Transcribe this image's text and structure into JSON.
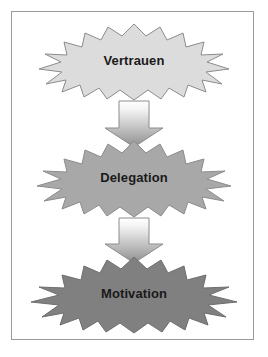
{
  "diagram": {
    "background_color": "#ffffff",
    "frame_color": "#9a9a9a",
    "text_color": "#1a1a1a",
    "nodes": [
      {
        "id": "node-vertrauen",
        "label": "Vertrauen",
        "shape": "explosion-star",
        "fill": "#dcdcdc",
        "stroke": "#8c8c8c"
      },
      {
        "id": "node-delegation",
        "label": "Delegation",
        "shape": "explosion-star",
        "fill": "#a8a8a8",
        "stroke": "#8c8c8c"
      },
      {
        "id": "node-motivation",
        "label": "Motivation",
        "shape": "explosion-star",
        "fill": "#808080",
        "stroke": "#6e6e6e"
      }
    ],
    "connectors": [
      {
        "id": "arrow-vertrauen-delegation",
        "shape": "block-arrow-down",
        "gradient_from": "#ffffff",
        "gradient_to": "#8f8f8f",
        "stroke": "#8c8c8c"
      },
      {
        "id": "arrow-delegation-motivation",
        "shape": "block-arrow-down",
        "gradient_from": "#ffffff",
        "gradient_to": "#8f8f8f",
        "stroke": "#8c8c8c"
      }
    ]
  }
}
